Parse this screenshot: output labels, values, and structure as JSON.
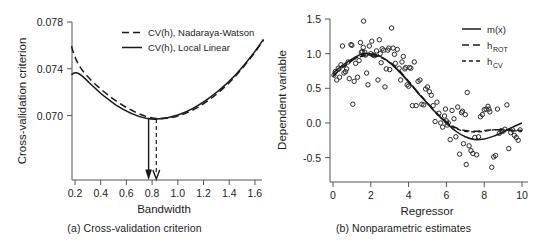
{
  "figure": {
    "background": "#ffffff",
    "ink": "#1a1a1a"
  },
  "panel_a": {
    "caption": "(a) Cross-validation criterion",
    "xlabel": "Bandwidth",
    "ylabel": "Cross-validation criterion",
    "xticks": [
      "0.2",
      "0.4",
      "0.6",
      "0.8",
      "1.0",
      "1.2",
      "1.4",
      "1.6"
    ],
    "yticks": [
      "0.070",
      "0.074",
      "0.078"
    ],
    "legend": [
      {
        "label": "CV(h), Nadaraya-Watson",
        "style": "dashed"
      },
      {
        "label": "CV(h), Local Linear",
        "style": "solid"
      }
    ]
  },
  "panel_b": {
    "caption": "(b) Nonparametric estimates",
    "xlabel": "Regressor",
    "ylabel": "Dependent variable",
    "xticks": [
      "0",
      "2",
      "4",
      "6",
      "8",
      "10"
    ],
    "yticks": [
      "-0.5",
      "0.0",
      "0.5",
      "1.0",
      "1.5"
    ],
    "legend": [
      {
        "label": "m(x)",
        "sub": "",
        "style": "solid"
      },
      {
        "label": "h",
        "sub": "ROT",
        "style": "dashed"
      },
      {
        "label": "h",
        "sub": "CV",
        "style": "dash-dot"
      }
    ]
  },
  "chart_data": [
    {
      "type": "line",
      "panel": "a",
      "title": "(a) Cross-validation criterion",
      "xlabel": "Bandwidth",
      "ylabel": "Cross-validation criterion",
      "xlim": [
        0.18,
        1.66
      ],
      "ylim": [
        0.0685,
        0.0781
      ],
      "xticks": [
        0.2,
        0.4,
        0.6,
        0.8,
        1.0,
        1.2,
        1.4,
        1.6
      ],
      "yticks": [
        0.07,
        0.074,
        0.078
      ],
      "grid": false,
      "legend_position": "top-center",
      "series": [
        {
          "name": "CV(h), Nadaraya-Watson",
          "style": "dashed",
          "x": [
            0.19,
            0.25,
            0.3,
            0.35,
            0.4,
            0.45,
            0.5,
            0.55,
            0.6,
            0.65,
            0.7,
            0.75,
            0.8,
            0.83,
            0.9,
            0.95,
            1.0,
            1.05,
            1.1,
            1.2,
            1.3,
            1.4,
            1.5,
            1.6,
            1.65
          ],
          "y": [
            0.0752,
            0.07435,
            0.07375,
            0.07325,
            0.07283,
            0.07243,
            0.07205,
            0.07172,
            0.07142,
            0.07117,
            0.07095,
            0.07079,
            0.07069,
            0.07067,
            0.07073,
            0.07082,
            0.07097,
            0.07116,
            0.07138,
            0.07196,
            0.07269,
            0.07356,
            0.07462,
            0.07594,
            0.07665
          ]
        },
        {
          "name": "CV(h), Local Linear",
          "style": "solid",
          "x": [
            0.19,
            0.22,
            0.25,
            0.3,
            0.35,
            0.4,
            0.45,
            0.5,
            0.55,
            0.6,
            0.65,
            0.7,
            0.75,
            0.77,
            0.8,
            0.85,
            0.9,
            0.95,
            1.0,
            1.05,
            1.1,
            1.2,
            1.3,
            1.4,
            1.5,
            1.6,
            1.65
          ],
          "y": [
            0.07383,
            0.07395,
            0.07386,
            0.07345,
            0.07303,
            0.07261,
            0.07221,
            0.07185,
            0.07152,
            0.07124,
            0.07101,
            0.07081,
            0.07069,
            0.07067,
            0.07068,
            0.07074,
            0.07083,
            0.07096,
            0.07112,
            0.07131,
            0.07153,
            0.07208,
            0.07277,
            0.07361,
            0.07462,
            0.07585,
            0.07655
          ]
        }
      ],
      "annotations": [
        {
          "type": "arrow",
          "style": "solid",
          "x": 0.772,
          "label": "local linear optimum"
        },
        {
          "type": "arrow",
          "style": "dashed",
          "x": 0.832,
          "label": "Nadaraya-Watson optimum"
        }
      ]
    },
    {
      "type": "scatter",
      "panel": "b",
      "title": "(b) Nonparametric estimates",
      "xlabel": "Regressor",
      "ylabel": "Dependent variable",
      "xlim": [
        -0.15,
        10.2
      ],
      "ylim": [
        -0.72,
        1.58
      ],
      "xticks": [
        0,
        2,
        4,
        6,
        8,
        10
      ],
      "yticks": [
        -0.5,
        0.0,
        0.5,
        1.0,
        1.5
      ],
      "grid": false,
      "legend_position": "top-right",
      "marker": "open-circle",
      "points": [
        [
          0.05,
          0.69
        ],
        [
          0.12,
          0.74
        ],
        [
          0.2,
          0.62
        ],
        [
          0.28,
          0.79
        ],
        [
          0.35,
          0.66
        ],
        [
          0.42,
          0.84
        ],
        [
          0.5,
          1.11
        ],
        [
          0.58,
          0.72
        ],
        [
          0.66,
          0.74
        ],
        [
          0.72,
          0.78
        ],
        [
          0.8,
          0.88
        ],
        [
          0.86,
          0.64
        ],
        [
          0.95,
          1.13
        ],
        [
          1.0,
          1.12
        ],
        [
          1.05,
          0.27
        ],
        [
          1.12,
          0.6
        ],
        [
          1.2,
          0.86
        ],
        [
          1.3,
          0.66
        ],
        [
          1.38,
          0.9
        ],
        [
          1.45,
          1.16
        ],
        [
          1.5,
          1.02
        ],
        [
          1.55,
          1.03
        ],
        [
          1.6,
          1.09
        ],
        [
          1.62,
          1.47
        ],
        [
          1.68,
          1.02
        ],
        [
          1.72,
          0.98
        ],
        [
          1.78,
          0.72
        ],
        [
          1.85,
          0.55
        ],
        [
          1.92,
          1.11
        ],
        [
          2.0,
          1.0
        ],
        [
          2.05,
          1.18
        ],
        [
          2.12,
          0.98
        ],
        [
          2.2,
          0.97
        ],
        [
          2.3,
          1.04
        ],
        [
          2.38,
          0.62
        ],
        [
          2.45,
          1.2
        ],
        [
          2.5,
          1.0
        ],
        [
          2.55,
          0.87
        ],
        [
          2.6,
          1.07
        ],
        [
          2.68,
          1.05
        ],
        [
          2.75,
          0.52
        ],
        [
          2.82,
          0.78
        ],
        [
          2.9,
          1.05
        ],
        [
          2.95,
          1.08
        ],
        [
          3.0,
          0.77
        ],
        [
          3.1,
          1.37
        ],
        [
          3.18,
          1.08
        ],
        [
          3.25,
          0.99
        ],
        [
          3.3,
          0.86
        ],
        [
          3.4,
          1.06
        ],
        [
          3.5,
          0.79
        ],
        [
          3.58,
          0.62
        ],
        [
          3.65,
          0.88
        ],
        [
          3.72,
          0.96
        ],
        [
          3.8,
          0.78
        ],
        [
          3.85,
          0.8
        ],
        [
          3.92,
          0.55
        ],
        [
          4.0,
          0.53
        ],
        [
          4.05,
          0.8
        ],
        [
          4.12,
          0.79
        ],
        [
          4.2,
          0.25
        ],
        [
          4.3,
          0.88
        ],
        [
          4.4,
          0.25
        ],
        [
          4.5,
          0.6
        ],
        [
          4.6,
          0.62
        ],
        [
          4.7,
          0.27
        ],
        [
          4.8,
          0.26
        ],
        [
          4.9,
          0.49
        ],
        [
          5.0,
          0.52
        ],
        [
          5.1,
          0.45
        ],
        [
          5.2,
          0.4
        ],
        [
          5.3,
          0.25
        ],
        [
          5.4,
          0.02
        ],
        [
          5.5,
          0.3
        ],
        [
          5.6,
          0.14
        ],
        [
          5.7,
          0.0
        ],
        [
          5.8,
          -0.06
        ],
        [
          5.9,
          0.1
        ],
        [
          5.95,
          0.2
        ],
        [
          6.0,
          0.03
        ],
        [
          6.05,
          -0.03
        ],
        [
          6.1,
          0.0
        ],
        [
          6.2,
          -0.24
        ],
        [
          6.3,
          0.18
        ],
        [
          6.4,
          0.06
        ],
        [
          6.5,
          -0.2
        ],
        [
          6.6,
          0.23
        ],
        [
          6.7,
          -0.45
        ],
        [
          6.8,
          0.15
        ],
        [
          6.85,
          0.17
        ],
        [
          6.9,
          -0.3
        ],
        [
          7.0,
          0.12
        ],
        [
          7.05,
          -0.6
        ],
        [
          7.1,
          0.44
        ],
        [
          7.2,
          -0.33
        ],
        [
          7.3,
          -0.4
        ],
        [
          7.4,
          -0.44
        ],
        [
          7.5,
          -0.21
        ],
        [
          7.6,
          -0.46
        ],
        [
          7.7,
          -0.2
        ],
        [
          7.8,
          0.09
        ],
        [
          7.9,
          0.12
        ],
        [
          8.0,
          0.19
        ],
        [
          8.1,
          0.2
        ],
        [
          8.2,
          0.24
        ],
        [
          8.25,
          0.2
        ],
        [
          8.3,
          0.16
        ],
        [
          8.4,
          -0.64
        ],
        [
          8.5,
          -0.49
        ],
        [
          8.6,
          -0.47
        ],
        [
          8.7,
          0.2
        ],
        [
          8.8,
          -0.15
        ],
        [
          8.9,
          -0.11
        ],
        [
          9.0,
          -0.12
        ],
        [
          9.1,
          -0.09
        ],
        [
          9.2,
          0.26
        ],
        [
          9.3,
          -0.37
        ],
        [
          9.4,
          -0.14
        ],
        [
          9.5,
          -0.1
        ],
        [
          9.6,
          -0.18
        ],
        [
          9.7,
          -0.21
        ],
        [
          9.8,
          -0.25
        ],
        [
          9.9,
          -0.1
        ]
      ],
      "series": [
        {
          "name": "m(x)",
          "style": "solid",
          "x": [
            0.0,
            0.5,
            1.0,
            1.5,
            2.0,
            2.5,
            3.0,
            3.5,
            4.0,
            4.5,
            5.0,
            5.5,
            6.0,
            6.5,
            7.0,
            7.5,
            8.0,
            8.5,
            9.0,
            9.5,
            10.0
          ],
          "y": [
            0.72,
            0.83,
            0.92,
            0.99,
            1.0,
            0.96,
            0.87,
            0.74,
            0.59,
            0.43,
            0.28,
            0.13,
            0.0,
            -0.12,
            -0.2,
            -0.24,
            -0.23,
            -0.19,
            -0.13,
            -0.06,
            0.0
          ]
        },
        {
          "name": "h_ROT",
          "style": "dashed",
          "x": [
            0.0,
            0.5,
            1.0,
            1.5,
            2.0,
            2.5,
            3.0,
            3.5,
            4.0,
            4.5,
            5.0,
            5.5,
            6.0,
            6.5,
            7.0,
            7.5,
            8.0,
            8.5,
            9.0,
            9.5,
            10.0
          ],
          "y": [
            0.68,
            0.8,
            0.9,
            0.96,
            0.97,
            0.95,
            0.88,
            0.76,
            0.6,
            0.44,
            0.29,
            0.14,
            0.02,
            -0.07,
            -0.11,
            -0.12,
            -0.11,
            -0.1,
            -0.1,
            -0.1,
            -0.11
          ]
        },
        {
          "name": "h_CV",
          "style": "dash-dot",
          "x": [
            0.0,
            0.5,
            1.0,
            1.5,
            2.0,
            2.5,
            3.0,
            3.5,
            4.0,
            4.5,
            5.0,
            5.5,
            6.0,
            6.5,
            7.0,
            7.5,
            8.0,
            8.5,
            9.0,
            9.5,
            10.0
          ],
          "y": [
            0.67,
            0.79,
            0.9,
            0.97,
            0.98,
            0.95,
            0.87,
            0.75,
            0.6,
            0.44,
            0.28,
            0.13,
            0.01,
            -0.08,
            -0.12,
            -0.13,
            -0.12,
            -0.1,
            -0.1,
            -0.11,
            -0.12
          ]
        }
      ]
    }
  ]
}
